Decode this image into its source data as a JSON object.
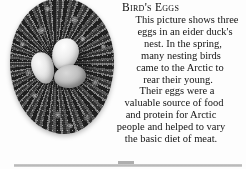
{
  "page": {
    "background_color": "#fdfdfd",
    "text_color": "#131313"
  },
  "photo": {
    "caption_subject": "bird-nest-with-three-eggs",
    "description": "Black and white photograph of a circular eider duck down nest containing three pale eggs",
    "eggs": [
      {
        "name": "egg-top-right",
        "tone": "#f1f0ec"
      },
      {
        "name": "egg-left",
        "tone": "#eceae4"
      },
      {
        "name": "egg-bottom-right",
        "tone": "#c6c3ba"
      }
    ],
    "nest_color": "#4c4c4a"
  },
  "article": {
    "title": "Bird's Eggs",
    "lines": [
      "This picture shows three",
      "eggs in an eider duck's",
      "nest. In the spring,",
      "many nesting birds",
      "came to the Arctic to",
      "rear their young.",
      "Their eggs were a",
      "valuable source of food",
      "and protein for Arctic",
      "people and helped to vary",
      "the basic diet of meat."
    ],
    "full_text": "This picture shows three eggs in an eider duck's nest. In the spring, many nesting birds came to the Arctic to rear their young. Their eggs were a valuable source of food and protein for Arctic people and helped to vary the basic diet of meat."
  }
}
